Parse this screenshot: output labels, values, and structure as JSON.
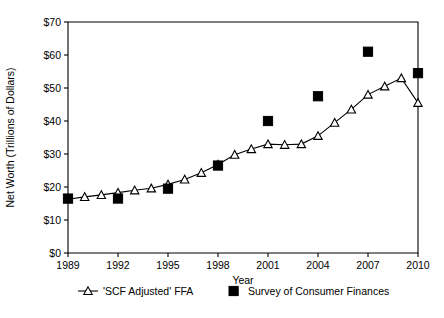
{
  "chart_data": {
    "type": "line",
    "title": "",
    "xlabel": "Year",
    "ylabel": "Net Worth (Trillions of Dollars)",
    "xlim": [
      1989,
      2010
    ],
    "ylim": [
      0,
      70
    ],
    "grid": false,
    "legend_position": "bottom",
    "x_ticks": [
      1989,
      1992,
      1995,
      1998,
      2001,
      2004,
      2007,
      2010
    ],
    "x_tick_labels": [
      "1989",
      "1992",
      "1995",
      "1998",
      "2001",
      "2004",
      "2007",
      "2010"
    ],
    "y_ticks": [
      0,
      10,
      20,
      30,
      40,
      50,
      60,
      70
    ],
    "y_tick_labels": [
      "$0",
      "$10",
      "$20",
      "$30",
      "$40",
      "$50",
      "$60",
      "$70"
    ],
    "series": [
      {
        "name": "'SCF Adjusted' FFA",
        "marker": "open-triangle",
        "style": "line-with-markers",
        "color": "#000000",
        "x": [
          1989,
          1990,
          1991,
          1992,
          1993,
          1994,
          1995,
          1996,
          1997,
          1998,
          1999,
          2000,
          2001,
          2002,
          2003,
          2004,
          2005,
          2006,
          2007,
          2008,
          2009,
          2010
        ],
        "values": [
          16.3,
          17.0,
          17.6,
          18.3,
          19.0,
          19.6,
          20.8,
          22.3,
          24.3,
          26.8,
          29.8,
          31.5,
          33.0,
          32.8,
          33.0,
          35.5,
          39.5,
          43.5,
          48.0,
          50.5,
          53.0,
          45.5
        ]
      },
      {
        "name": "Survey of Consumer Finances",
        "marker": "filled-square",
        "style": "markers-only",
        "color": "#000000",
        "x": [
          1989,
          1992,
          1995,
          1998,
          2001,
          2004,
          2007,
          2010
        ],
        "values": [
          16.5,
          16.5,
          19.5,
          26.5,
          40.0,
          47.5,
          61.0,
          54.5
        ]
      }
    ],
    "legend": [
      {
        "label": "'SCF Adjusted' FFA",
        "marker": "open-triangle-line"
      },
      {
        "label": "Survey of Consumer Finances",
        "marker": "filled-square"
      }
    ]
  }
}
